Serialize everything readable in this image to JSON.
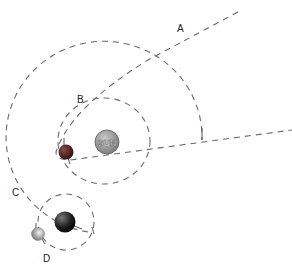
{
  "diagram": {
    "title": "",
    "labels": {
      "a": "A",
      "b": "B",
      "c": "C",
      "d": "D",
      "sun": "SUN"
    },
    "bodies": [
      {
        "id": "sun",
        "label": "SUN",
        "color": "#9a9a9a"
      },
      {
        "id": "planet-b",
        "label": "B",
        "color": "#5a2a26"
      },
      {
        "id": "planet-c",
        "label": "C",
        "color": "#222222"
      },
      {
        "id": "moon-d",
        "label": "D",
        "color": "#bdbdbd"
      }
    ],
    "paths": [
      {
        "id": "A",
        "description": "open comet path (parabolic) passing near the Sun"
      },
      {
        "id": "B",
        "description": "closed elliptical orbit around the Sun"
      },
      {
        "id": "C",
        "description": "large circular orbit around the Sun"
      },
      {
        "id": "D",
        "description": "small circular orbit around planet"
      }
    ],
    "colors": {
      "orbit_stroke": "#6a6a6a",
      "background": "#ffffff"
    }
  }
}
